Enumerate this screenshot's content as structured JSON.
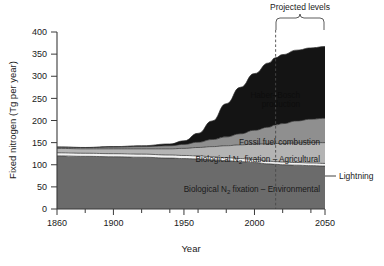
{
  "figure": {
    "background": "#ffffff",
    "axis_color": "#3a3a3a"
  },
  "chart_data": {
    "type": "area",
    "title": "",
    "subtitle": "",
    "xlabel": "Year",
    "ylabel": "Fixed nitrogen (Tg per year)",
    "xlim": [
      1860,
      2050
    ],
    "ylim": [
      0,
      400
    ],
    "grid": false,
    "legend_position": "inline-labels",
    "xticks": [
      1860,
      1900,
      1950,
      2000,
      2050
    ],
    "xtick_labels": [
      "1860",
      "1900",
      "1950",
      "2000",
      "2050"
    ],
    "xminor_ticks": [
      1880,
      1920,
      1940,
      1960,
      1980,
      2020,
      2040
    ],
    "yticks": [
      0,
      50,
      100,
      150,
      200,
      250,
      300,
      350,
      400
    ],
    "ytick_labels": [
      "0",
      "50",
      "100",
      "150",
      "200",
      "250",
      "300",
      "350",
      "400"
    ],
    "stacking": "bottom-to-top",
    "x": [
      1860,
      1880,
      1900,
      1920,
      1940,
      1950,
      1960,
      1970,
      1980,
      1990,
      2000,
      2010,
      2015,
      2020,
      2030,
      2040,
      2050
    ],
    "series": [
      {
        "name": "Biological N2 fixation - Environmental",
        "label": "Biological N",
        "label_sub": "2",
        "label_rest": " fixation – Environmental",
        "color": "#6b6b6b",
        "values": [
          120,
          119,
          118,
          117,
          115,
          114,
          113,
          111,
          109,
          107,
          105,
          102,
          101,
          100,
          99,
          98,
          97
        ]
      },
      {
        "name": "Lightning",
        "label": "Lightning",
        "color": "#f2f2f2",
        "values": [
          7,
          7,
          7,
          7,
          7,
          7,
          7,
          7,
          7,
          7,
          7,
          6,
          6,
          6,
          6,
          6,
          6
        ]
      },
      {
        "name": "Biological N2 fixation - Agricultural",
        "label": "Biological N",
        "label_sub": "2",
        "label_rest": " fixation – Agricultural",
        "color": "#b4b4b4",
        "values": [
          10,
          10,
          11,
          12,
          14,
          16,
          19,
          23,
          27,
          31,
          35,
          39,
          41,
          42,
          44,
          46,
          47
        ]
      },
      {
        "name": "Fossil fuel combustion",
        "label": "Fossil fuel combustion",
        "color": "#8f8f8f",
        "values": [
          3,
          3,
          4,
          5,
          7,
          9,
          12,
          16,
          20,
          25,
          31,
          38,
          42,
          45,
          50,
          53,
          55
        ]
      },
      {
        "name": "Haber-Bosch production",
        "label": "Haber–Bosch",
        "label_rest": "production",
        "color": "#141414",
        "values": [
          0,
          0,
          1,
          2,
          4,
          8,
          20,
          42,
          75,
          105,
          128,
          145,
          152,
          156,
          160,
          161,
          162
        ]
      }
    ],
    "annotations": [
      {
        "name": "projected-levels",
        "text": "Projected levels",
        "x_start": 2015,
        "x_end": 2050
      },
      {
        "name": "projection-divider",
        "text": "",
        "x": 2015,
        "style": "dashed"
      },
      {
        "name": "lightning-callout",
        "text": "Lightning",
        "points_to_year": 2050,
        "points_to_value": 100
      }
    ]
  }
}
